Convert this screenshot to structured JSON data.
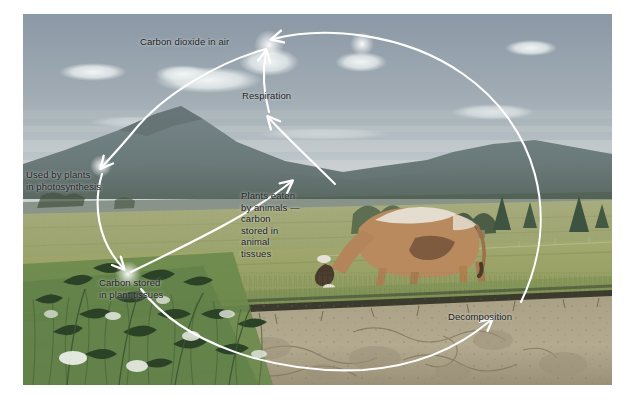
{
  "figure": {
    "kind": "carbon-cycle-illustration",
    "scene": "painted farmland landscape with mountains, sky with clouds, grazing cow, wildflowers and a cut-away soil cross-section",
    "arrow_color": "#ffffff",
    "label_color": "#1b1b1b",
    "palette": {
      "sky_top": "#8e9aa6",
      "sky_low": "#b9c2c6",
      "cloud": "#e8ecee",
      "mountain_far": "#6f7d80",
      "mountain_near": "#5d6b63",
      "field_far": "#9aa072",
      "field_mid": "#a9ab74",
      "field_near": "#9ba46a",
      "meadow_green": "#7f9456",
      "soil_light": "#b0a68c",
      "soil_dark": "#8d8167",
      "soil_band": "#2f2d26",
      "cow_body": "#b98a5e",
      "cow_white": "#e6e0d4",
      "tree_dark": "#4d6046",
      "barn_red": "#8d5a4a"
    }
  },
  "labels": [
    {
      "id": "co2",
      "text": "Carbon dioxide in air",
      "name": "label-carbon-dioxide-in-air"
    },
    {
      "id": "resp",
      "text": "Respiration",
      "name": "label-respiration"
    },
    {
      "id": "photo",
      "text": "Used by plants\nin photosynthesis",
      "name": "label-used-by-plants-in-photosynthesis"
    },
    {
      "id": "eaten",
      "text": "Plants eaten\nby animals —\ncarbon\nstored in\nanimal\ntissues",
      "name": "label-plants-eaten-by-animals"
    },
    {
      "id": "plant",
      "text": "Carbon stored\nin plant tissues",
      "name": "label-carbon-stored-in-plant-tissues"
    },
    {
      "id": "decomp",
      "text": "Decomposition",
      "name": "label-decomposition"
    }
  ],
  "flow": {
    "nodes": [
      "Carbon dioxide in air",
      "Used by plants in photosynthesis",
      "Carbon stored in plant tissues",
      "Plants eaten by animals — carbon stored in animal tissues",
      "Respiration",
      "Decomposition"
    ],
    "arrows": [
      {
        "from": "Carbon dioxide in air",
        "to": "Used by plants in photosynthesis"
      },
      {
        "from": "Used by plants in photosynthesis",
        "to": "Carbon stored in plant tissues"
      },
      {
        "from": "Carbon stored in plant tissues",
        "to": "Plants eaten by animals — carbon stored in animal tissues"
      },
      {
        "from": "Plants eaten by animals — carbon stored in animal tissues",
        "to": "Respiration"
      },
      {
        "from": "Respiration",
        "to": "Carbon dioxide in air"
      },
      {
        "from": "Carbon dioxide in air",
        "to": "Decomposition"
      },
      {
        "from": "Carbon stored in plant tissues",
        "to": "Decomposition"
      }
    ]
  }
}
